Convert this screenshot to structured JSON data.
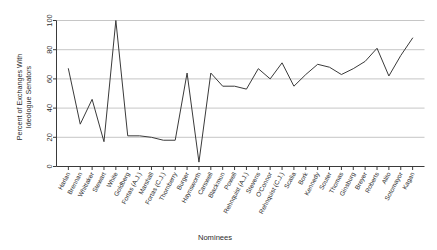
{
  "chart_data": {
    "type": "line",
    "title": "",
    "xlabel": "Nominees",
    "ylabel": "Percent of Exchanges With Ideologue Senators",
    "ylabel_lines": [
      "Percent of Exchanges With",
      "Ideologue Senators"
    ],
    "ylim": [
      0,
      100
    ],
    "yticks": [
      0,
      20,
      40,
      60,
      80,
      100
    ],
    "ytick_labels": [
      "0",
      "20",
      "40",
      "60",
      "80",
      "100"
    ],
    "grid": "horizontal",
    "legend": "none",
    "line_color": "#3a3a3a",
    "categories": [
      "Harlan",
      "Brennan",
      "Whittaker",
      "Stewart",
      "White",
      "Goldberg",
      "Fortas (A.J.)",
      "Marshall",
      "Fortas (C.J.)",
      "Thornberry",
      "Burger",
      "Haynsworth",
      "Carswell",
      "Blackmun",
      "Powell",
      "Rehnquist (A.J.)",
      "Stevens",
      "O'Connor",
      "Rehnquist (C.J.)",
      "Scalia",
      "Bork",
      "Kennedy",
      "Souter",
      "Thomas",
      "Ginsburg",
      "Breyer",
      "Roberts",
      "Alito",
      "Sotomayor",
      "Kagan"
    ],
    "values": [
      67,
      29,
      46,
      17,
      100,
      21,
      21,
      20,
      18,
      18,
      64,
      3,
      64,
      55,
      55,
      53,
      67,
      60,
      71,
      55,
      63,
      70,
      68,
      63,
      67,
      72,
      81,
      62,
      76,
      88
    ]
  }
}
